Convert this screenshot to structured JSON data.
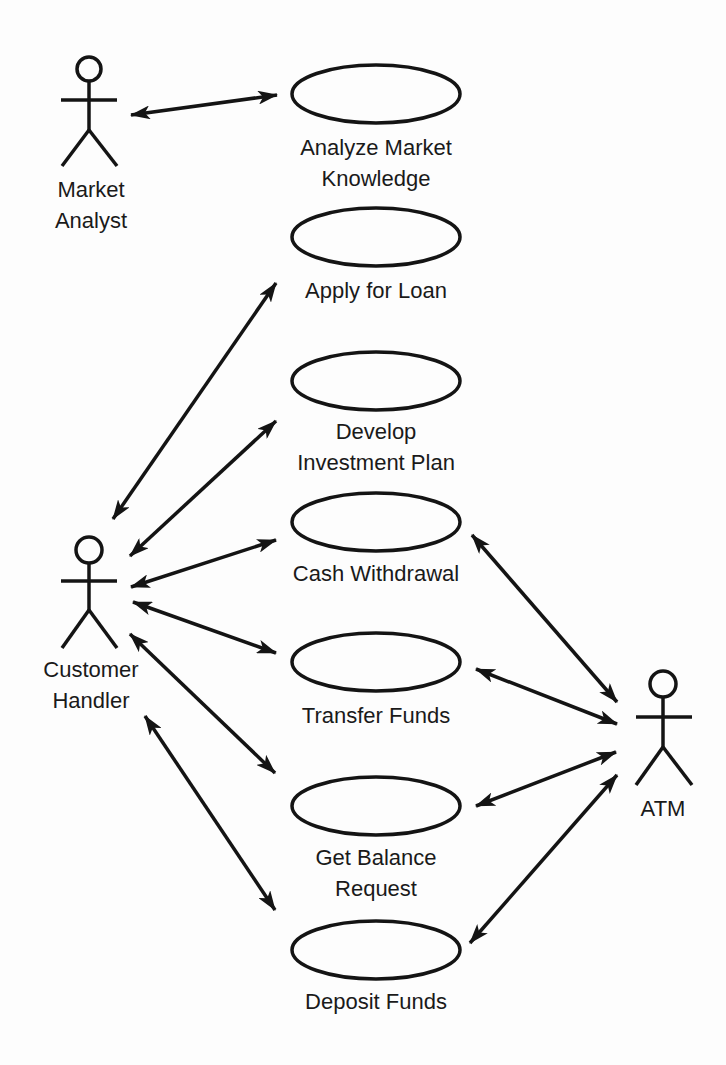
{
  "diagram": {
    "type": "use-case",
    "stroke_color": "#141414",
    "background": "#fdfdfd",
    "actors": [
      {
        "id": "market_analyst",
        "lines": [
          "Market",
          "Analyst"
        ],
        "x": 89,
        "head_y": 69
      },
      {
        "id": "customer_handler",
        "lines": [
          "Customer",
          "Handler"
        ],
        "x": 89,
        "head_y": 550
      },
      {
        "id": "atm",
        "lines": [
          "ATM"
        ],
        "x": 663,
        "head_y": 684
      }
    ],
    "use_cases": [
      {
        "id": "analyze",
        "lines": [
          "Analyze Market",
          "Knowledge"
        ],
        "cx": 376,
        "cy": 94
      },
      {
        "id": "loan",
        "lines": [
          "Apply for Loan"
        ],
        "cx": 376,
        "cy": 237
      },
      {
        "id": "invest",
        "lines": [
          "Develop",
          "Investment Plan"
        ],
        "cx": 376,
        "cy": 381
      },
      {
        "id": "cash",
        "lines": [
          "Cash Withdrawal"
        ],
        "cx": 376,
        "cy": 522
      },
      {
        "id": "transfer",
        "lines": [
          "Transfer Funds"
        ],
        "cx": 376,
        "cy": 662
      },
      {
        "id": "balance",
        "lines": [
          "Get Balance",
          "Request"
        ],
        "cx": 376,
        "cy": 806
      },
      {
        "id": "deposit",
        "lines": [
          "Deposit Funds"
        ],
        "cx": 376,
        "cy": 950
      }
    ],
    "associations": [
      {
        "from": "market_analyst",
        "to": "analyze",
        "bidirectional": true
      },
      {
        "from": "customer_handler",
        "to": "loan",
        "bidirectional": true
      },
      {
        "from": "customer_handler",
        "to": "invest",
        "bidirectional": true
      },
      {
        "from": "customer_handler",
        "to": "cash",
        "bidirectional": true
      },
      {
        "from": "customer_handler",
        "to": "transfer",
        "bidirectional": true
      },
      {
        "from": "customer_handler",
        "to": "balance",
        "bidirectional": true
      },
      {
        "from": "customer_handler",
        "to": "deposit",
        "bidirectional": true
      },
      {
        "from": "atm",
        "to": "cash",
        "bidirectional": true
      },
      {
        "from": "atm",
        "to": "transfer",
        "bidirectional": true
      },
      {
        "from": "atm",
        "to": "balance",
        "bidirectional": true
      },
      {
        "from": "atm",
        "to": "deposit",
        "bidirectional": true
      }
    ]
  },
  "labels": {
    "market_analyst": {
      "l1": "Market",
      "l2": "Analyst"
    },
    "customer_handler": {
      "l1": "Customer",
      "l2": "Handler"
    },
    "atm": {
      "l1": "ATM"
    },
    "analyze": {
      "l1": "Analyze Market",
      "l2": "Knowledge"
    },
    "loan": {
      "l1": "Apply for Loan"
    },
    "invest": {
      "l1": "Develop",
      "l2": "Investment Plan"
    },
    "cash": {
      "l1": "Cash Withdrawal"
    },
    "transfer": {
      "l1": "Transfer Funds"
    },
    "balance": {
      "l1": "Get Balance",
      "l2": "Request"
    },
    "deposit": {
      "l1": "Deposit Funds"
    }
  }
}
